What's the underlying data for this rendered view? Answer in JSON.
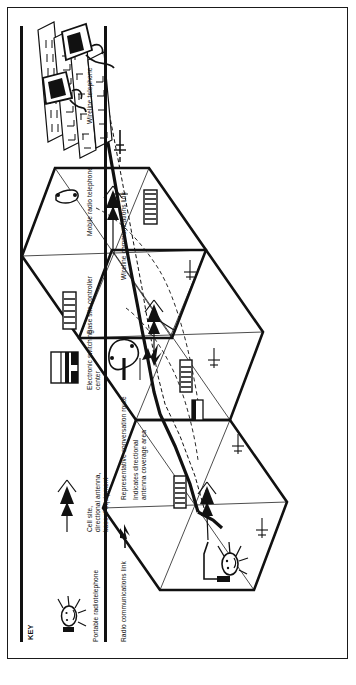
{
  "figure": {
    "domain_note": "Isometric technical illustration of a cellular radiotelephone system",
    "orientation": "artwork rotated 90 degrees counter-clockwise within the page frame"
  },
  "key": {
    "title": "KEY",
    "symbols": [
      {
        "id": "portable-radiotelephone",
        "label": "Portable radiotelephone",
        "icon": "portable-radiotelephone-icon"
      },
      {
        "id": "cell-site",
        "label": "Cell site,\ndirectional antenna,\nbase rf equipment",
        "label_lines": [
          "Cell site,",
          "directional antenna,",
          "base rf equipment"
        ],
        "icon": "directional-antenna-icon"
      },
      {
        "id": "electronic-switching-center",
        "label": "Electronic switching\ncenter",
        "label_lines": [
          "Electronic switching",
          "center"
        ],
        "icon": "switching-center-icon"
      },
      {
        "id": "base-site-controller",
        "label": "Base site controller",
        "label_lines": [
          "Base site controller"
        ],
        "icon": "base-site-controller-icon"
      },
      {
        "id": "mobile-radio-telephone",
        "label": "Mobile radio telephone",
        "label_lines": [
          "Mobile radio telephone"
        ],
        "icon": "mobile-radio-telephone-icon"
      },
      {
        "id": "wireline-telephone",
        "label": "Wireline telephone",
        "label_lines": [
          "Wireline telephone"
        ],
        "icon": "wireline-telephone-icon"
      }
    ],
    "lines": [
      {
        "id": "radio-communications-link",
        "label": "Radio communications link",
        "icon": "lightning-bolt-icon"
      },
      {
        "id": "representative-conversation-route",
        "label": "Representative conversation route",
        "icon": "thick-solid-line-icon"
      },
      {
        "id": "antenna-coverage-area",
        "label": "Indicates directional\nantenna coverage area",
        "label_lines": [
          "Indicates directional",
          "antenna coverage area"
        ],
        "icon": "thin-solid-line-icon"
      },
      {
        "id": "wireline-communications-link",
        "label": "Wireline communications link",
        "icon": "dashed-crossbar-line-icon"
      }
    ]
  },
  "diagram": {
    "cells": [
      {
        "id": "cell-top",
        "name": "hexagonal-cell-upper"
      },
      {
        "id": "cell-middle",
        "name": "hexagonal-cell-middle"
      },
      {
        "id": "cell-bottom",
        "name": "hexagonal-cell-lower"
      }
    ],
    "nodes": [
      {
        "id": "cell-site-upper",
        "name": "cell-site-antenna-upper"
      },
      {
        "id": "cell-site-middle",
        "name": "cell-site-antenna-middle"
      },
      {
        "id": "cell-site-lower",
        "name": "cell-site-antenna-lower"
      },
      {
        "id": "bsc-upper",
        "name": "base-site-controller-upper"
      },
      {
        "id": "bsc-middle",
        "name": "base-site-controller-middle"
      },
      {
        "id": "bsc-lower",
        "name": "base-site-controller-lower"
      },
      {
        "id": "esc",
        "name": "electronic-switching-center-building"
      },
      {
        "id": "wireline-phone",
        "name": "wireline-telephone-handset"
      },
      {
        "id": "mobile-unit",
        "name": "mobile-radio-telephone-vehicle"
      },
      {
        "id": "portable-user",
        "name": "portable-radiotelephone-user"
      }
    ]
  },
  "colors": {
    "ink": "#111111",
    "paper": "#ffffff",
    "frame": "#1a1a1a"
  }
}
